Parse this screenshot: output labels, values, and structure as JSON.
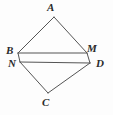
{
  "figure": {
    "kind": "plane-geometry-diagram",
    "background_color": "#fdfdfd",
    "stroke_color": "#555555",
    "label_color": "#2b2b2b",
    "width": 113,
    "height": 115,
    "labels": {
      "A": "A",
      "B": "B",
      "C": "C",
      "D": "D",
      "M": "M",
      "N": "N"
    },
    "points": {
      "A": {
        "x": 54,
        "y": 17
      },
      "B": {
        "x": 18,
        "y": 53
      },
      "N": {
        "x": 20,
        "y": 62
      },
      "M": {
        "x": 87,
        "y": 53
      },
      "D": {
        "x": 90,
        "y": 63
      },
      "C": {
        "x": 48,
        "y": 93
      }
    },
    "segments": [
      {
        "name": "AB",
        "from": "A",
        "to": "B"
      },
      {
        "name": "AM",
        "from": "A",
        "to": "M"
      },
      {
        "name": "BM",
        "from": "B",
        "to": "M"
      },
      {
        "name": "ND",
        "from": "N",
        "to": "D"
      },
      {
        "name": "BN",
        "from": "B",
        "to": "N"
      },
      {
        "name": "MD",
        "from": "M",
        "to": "D"
      },
      {
        "name": "NC",
        "from": "N",
        "to": "C"
      },
      {
        "name": "CD",
        "from": "C",
        "to": "D"
      }
    ]
  }
}
